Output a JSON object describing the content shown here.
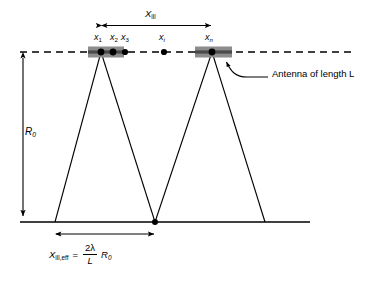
{
  "figure": {
    "type": "diagram",
    "labels": {
      "x_ill": "X",
      "x_ill_sub": "ill",
      "r0": "R",
      "r0_sub": "0",
      "antenna_callout": "Antenna of length L",
      "point_1": "x",
      "point_1_sub": "1",
      "point_2": "x",
      "point_2_sub": "2",
      "point_3": "x",
      "point_3_sub": "3",
      "point_i": "x",
      "point_i_sub": "i",
      "point_n": "x",
      "point_n_sub": "n"
    },
    "equation": {
      "lhs": "X",
      "lhs_sub": "ill,eff",
      "equals": "=",
      "numerator": "2λ",
      "denominator": "L",
      "trailing": "R",
      "trailing_sub": "0"
    },
    "colors": {
      "stroke": "#000000",
      "antenna_fill": "#8c8c8c",
      "antenna_core": "#4a4a4a",
      "background": "#ffffff"
    },
    "geometry": {
      "antenna_axis_y": 52,
      "ground_y": 222,
      "antenna_block_left": [
        88,
        124
      ],
      "antenna_block_right": [
        195,
        232
      ],
      "point_x_positions": [
        101,
        113,
        124,
        164,
        212
      ],
      "beam_apexes_x": [
        55,
        155,
        265
      ],
      "x_ill_arrow": [
        101,
        212
      ],
      "x_ill_eff_arrow": [
        55,
        155
      ],
      "r0_arrow_x": 23
    }
  }
}
